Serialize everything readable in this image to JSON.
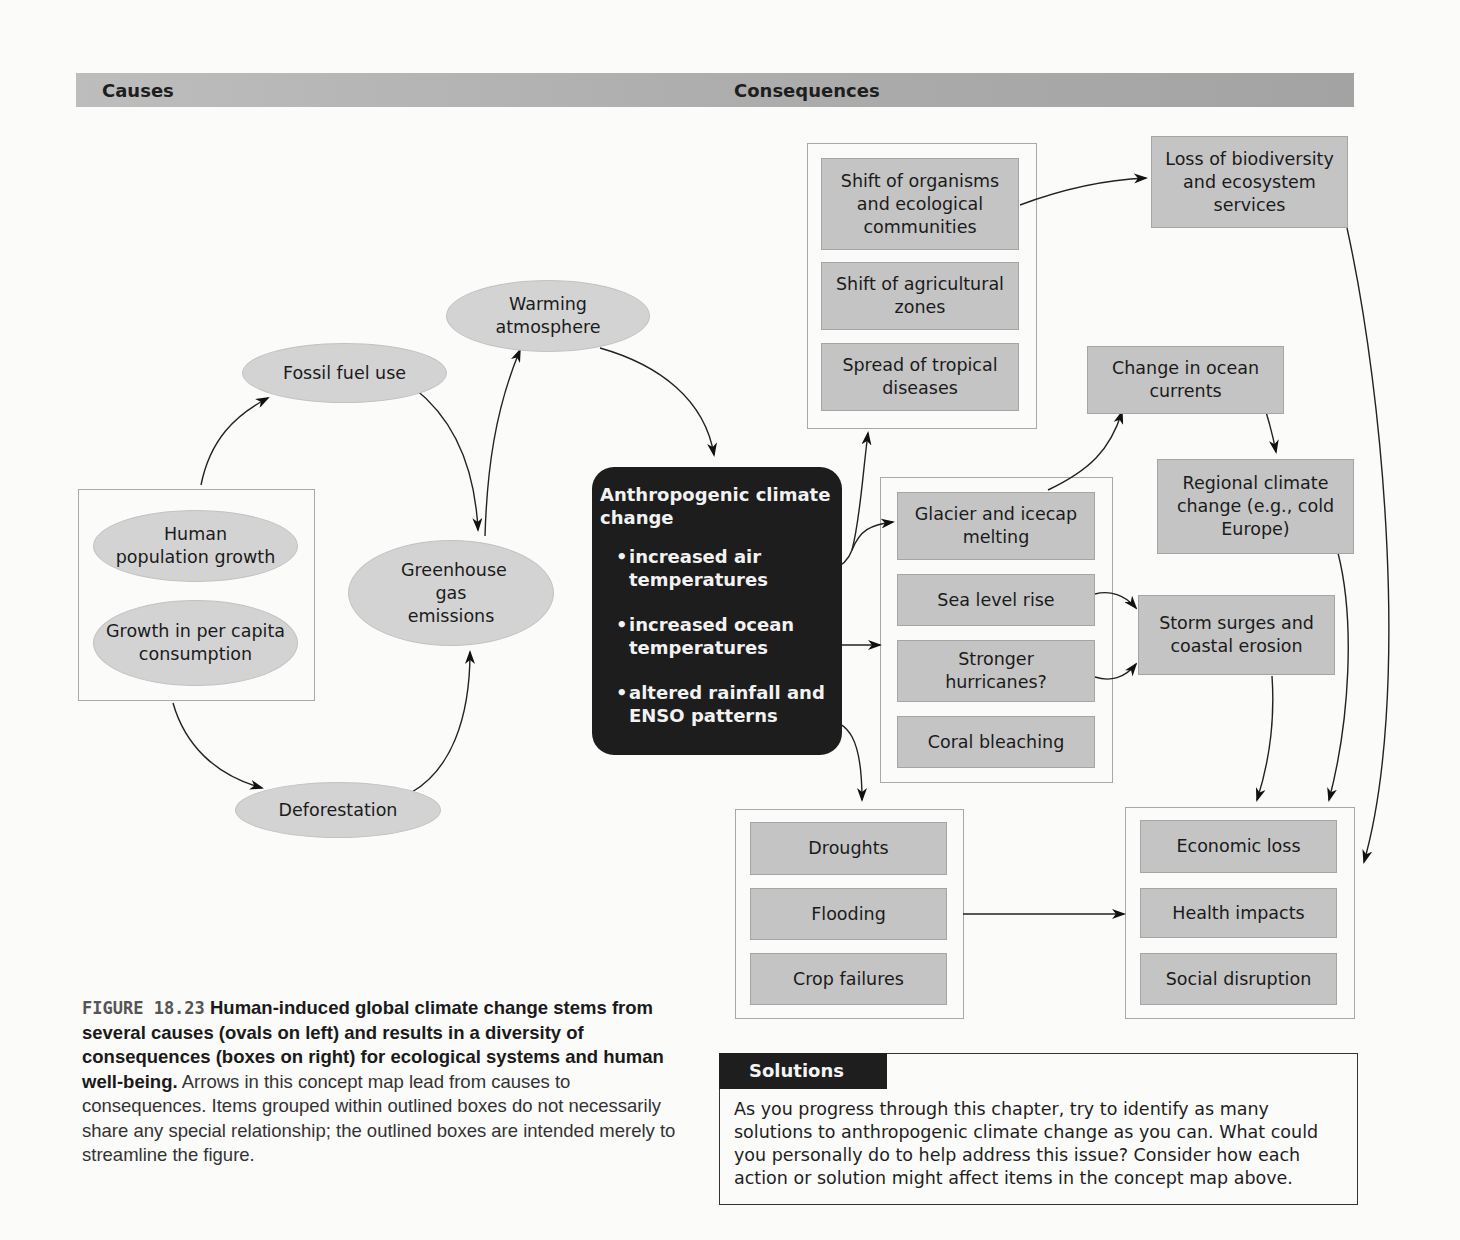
{
  "header": {
    "causes_label": "Causes",
    "consequences_label": "Consequences"
  },
  "causes": {
    "grouped": [
      {
        "id": "human-population-growth",
        "label": "Human population growth"
      },
      {
        "id": "growth-per-capita-consumption",
        "label": "Growth in per capita consumption"
      }
    ],
    "fossil_fuel_use": "Fossil fuel use",
    "deforestation": "Deforestation",
    "greenhouse_gas_emissions": "Greenhouse gas emissions",
    "warming_atmosphere": "Warming atmosphere"
  },
  "central": {
    "title": "Anthropogenic climate change",
    "bullets": [
      "increased air temperatures",
      "increased ocean temperatures",
      "altered rainfall and ENSO patterns"
    ]
  },
  "consequences": {
    "ecological_group": [
      "Shift of organisms and ecological communities",
      "Shift of agricultural zones",
      "Spread of tropical diseases"
    ],
    "biodiversity": "Loss of biodiversity and ecosystem services",
    "ocean_currents": "Change in ocean currents",
    "regional_climate": "Regional climate change (e.g., cold Europe)",
    "ice_sea_group": [
      "Glacier and icecap melting",
      "Sea level rise",
      "Stronger hurricanes?",
      "Coral bleaching"
    ],
    "storm_surges": "Storm surges and coastal erosion",
    "water_group": [
      "Droughts",
      "Flooding",
      "Crop failures"
    ],
    "human_group": [
      "Economic loss",
      "Health impacts",
      "Social disruption"
    ]
  },
  "caption": {
    "figure_number": "FIGURE 18.23",
    "bold_text": "Human-induced global climate change stems from several causes (ovals on left) and results in a diversity of consequences (boxes on right) for ecological systems and human well-being.",
    "body_text": "Arrows in this concept map lead from causes to consequences. Items grouped within outlined boxes do not necessarily share any special relationship; the outlined boxes are intended merely to streamline the figure."
  },
  "solutions": {
    "label": "Solutions",
    "text": "As you progress through this chapter, try to identify as many solutions to anthropogenic climate change as you can. What could you personally do to help address this issue? Consider how each action or solution might affect items in the concept map above."
  },
  "colors": {
    "box_fill": "#c4c4c4",
    "oval_fill": "#d3d3d3",
    "central_fill": "#1d1d1d",
    "header_bar": "#b0b0b0"
  }
}
